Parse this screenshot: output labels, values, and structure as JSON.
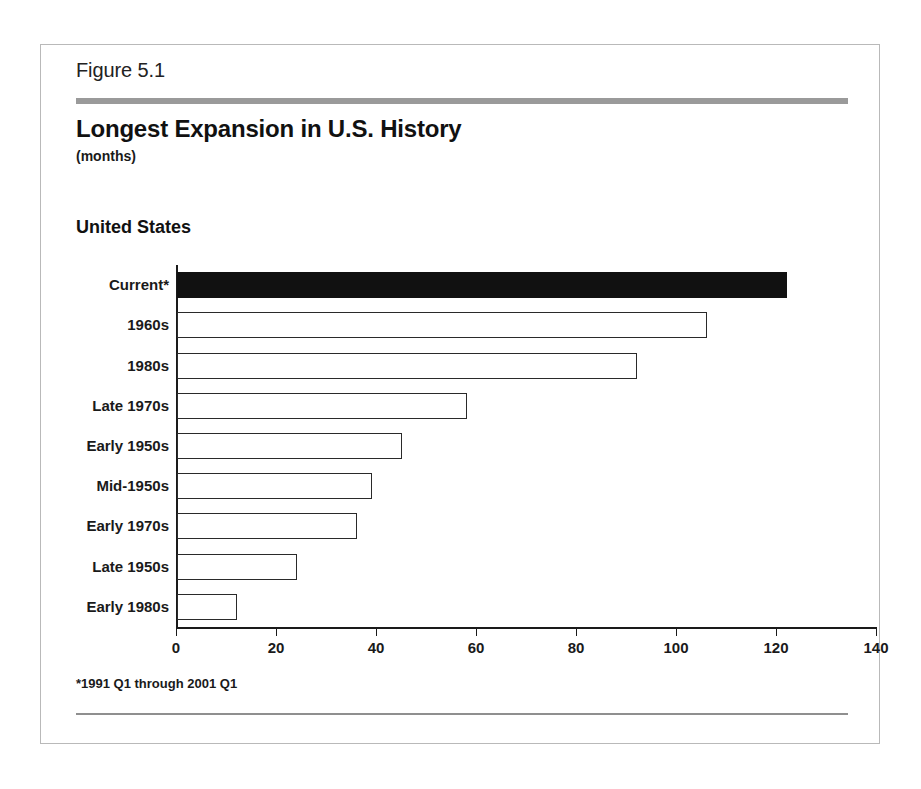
{
  "figure": {
    "number_label": "Figure 5.1",
    "title": "Longest Expansion in U.S. History",
    "units": "(months)",
    "region_label": "United States",
    "footnote": "*1991 Q1 through 2001 Q1"
  },
  "colors": {
    "header_rule": "#9a9a9a",
    "footer_rule": "#8f8f8f",
    "frame_border": "#b9b9b9",
    "bar_outline": "#2a2a2a",
    "bar_highlight_fill": "#111111",
    "text": "#1a1a1a"
  },
  "chart_data": {
    "type": "bar",
    "orientation": "horizontal",
    "title": "Longest Expansion in U.S. History",
    "subtitle": "(months)",
    "xlabel": "",
    "ylabel": "",
    "xlim": [
      0,
      140
    ],
    "xticks": [
      0,
      20,
      40,
      60,
      80,
      100,
      120,
      140
    ],
    "xtick_labels": [
      "0",
      "20",
      "40",
      "60",
      "80",
      "100",
      "120",
      "140"
    ],
    "grid": false,
    "legend": false,
    "annotations": [
      "*1991 Q1 through 2001 Q1"
    ],
    "categories": [
      "Current*",
      "1960s",
      "1980s",
      "Late 1970s",
      "Early 1950s",
      "Mid-1950s",
      "Early 1970s",
      "Late 1950s",
      "Early 1980s"
    ],
    "values": [
      122,
      106,
      92,
      58,
      45,
      39,
      36,
      24,
      12
    ],
    "highlighted": [
      true,
      false,
      false,
      false,
      false,
      false,
      false,
      false,
      false
    ]
  }
}
